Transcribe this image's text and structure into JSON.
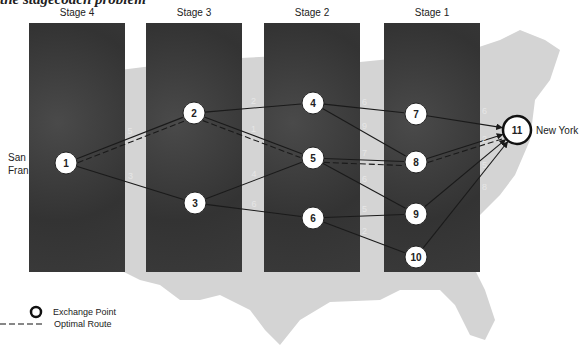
{
  "title": "the stagecoach problem",
  "stages": [
    {
      "label": "Stage 4",
      "x": 29
    },
    {
      "label": "Stage 3",
      "x": 146
    },
    {
      "label": "Stage 2",
      "x": 264
    },
    {
      "label": "Stage 1",
      "x": 384
    }
  ],
  "cities": {
    "origin": "San Francisco",
    "origin_visible": [
      "San",
      "Fran"
    ],
    "destination": "New York"
  },
  "nodes": [
    {
      "id": "1",
      "x": 66,
      "y": 163
    },
    {
      "id": "2",
      "x": 194,
      "y": 113
    },
    {
      "id": "3",
      "x": 195,
      "y": 203
    },
    {
      "id": "4",
      "x": 313,
      "y": 103
    },
    {
      "id": "5",
      "x": 313,
      "y": 158
    },
    {
      "id": "6",
      "x": 313,
      "y": 218
    },
    {
      "id": "7",
      "x": 416,
      "y": 114
    },
    {
      "id": "8",
      "x": 416,
      "y": 162
    },
    {
      "id": "9",
      "x": 416,
      "y": 214
    },
    {
      "id": "10",
      "x": 416,
      "y": 257
    },
    {
      "id": "11",
      "x": 517,
      "y": 130
    }
  ],
  "edges": [
    {
      "from": "1",
      "to": "2",
      "weight": "5",
      "optimal": true
    },
    {
      "from": "1",
      "to": "3",
      "weight": "3",
      "optimal": false
    },
    {
      "from": "2",
      "to": "4",
      "weight": "2",
      "optimal": false
    },
    {
      "from": "2",
      "to": "5",
      "weight": "1",
      "optimal": true
    },
    {
      "from": "3",
      "to": "5",
      "weight": "4",
      "optimal": false
    },
    {
      "from": "3",
      "to": "6",
      "weight": "6",
      "optimal": false
    },
    {
      "from": "4",
      "to": "7",
      "weight": "6",
      "optimal": false
    },
    {
      "from": "4",
      "to": "8",
      "weight": "9",
      "optimal": false
    },
    {
      "from": "5",
      "to": "8",
      "weight": "7",
      "optimal": true
    },
    {
      "from": "5",
      "to": "9",
      "weight": "6",
      "optimal": false
    },
    {
      "from": "6",
      "to": "9",
      "weight": "5",
      "optimal": false
    },
    {
      "from": "6",
      "to": "10",
      "weight": "2",
      "optimal": false
    },
    {
      "from": "7",
      "to": "11",
      "weight": "6",
      "optimal": false
    },
    {
      "from": "8",
      "to": "11",
      "weight": "2",
      "optimal": true
    },
    {
      "from": "9",
      "to": "11",
      "weight": "5",
      "optimal": false
    },
    {
      "from": "10",
      "to": "11",
      "weight": "8",
      "optimal": false
    }
  ],
  "legend": {
    "exchange_point": "Exchange Point",
    "optimal_route": "Optimal Route"
  },
  "colors": {
    "stage_box": "#3d3d3d",
    "map": "#d4d4d4",
    "node_fill": "#ffffff",
    "edge": "#1a1a1a"
  }
}
